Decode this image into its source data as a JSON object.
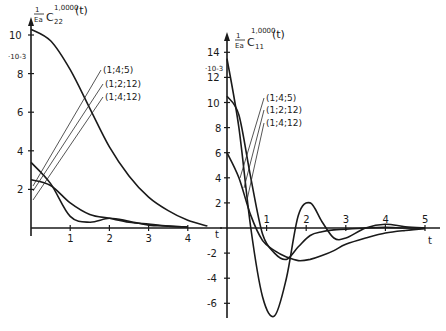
{
  "chart_data": [
    {
      "type": "line",
      "panel": "left",
      "title": "1/Ea C22^1,0000(t)",
      "title_parts": {
        "frac_num": "1",
        "frac_den": "Ea",
        "symbol": "C",
        "sub": "22",
        "sup": "1,0000",
        "arg": "(t)"
      },
      "scale_label": "·10-3",
      "xlabel": "t",
      "ylabel": "",
      "xlim": [
        0,
        4.7
      ],
      "ylim": [
        0,
        10.5
      ],
      "x_ticks": [
        "1",
        "2",
        "3",
        "4"
      ],
      "y_ticks": [
        "2",
        "4",
        "6",
        "8",
        "10"
      ],
      "grid": false,
      "legend_labels": [
        "(1;4;5)",
        "(1;2;12)",
        "(1;4;12)"
      ],
      "series": [
        {
          "name": "upper (monotone)",
          "x": [
            0,
            0.5,
            1.0,
            1.5,
            2.0,
            2.5,
            3.0,
            3.5,
            4.0,
            4.5
          ],
          "values": [
            10.3,
            9.7,
            8.2,
            6.2,
            4.2,
            2.7,
            1.6,
            0.9,
            0.4,
            0.1
          ]
        },
        {
          "name": "(1;4;5)",
          "x": [
            0,
            0.5,
            1.0,
            1.5,
            2.0,
            2.5,
            3.0,
            3.5,
            4.0
          ],
          "values": [
            3.4,
            2.3,
            0.6,
            0.3,
            0.5,
            0.35,
            0.15,
            0.1,
            0.05
          ]
        },
        {
          "name": "(1;4;12)",
          "x": [
            0,
            0.5,
            1.0,
            1.5,
            2.0,
            2.5,
            3.0,
            3.5,
            4.0
          ],
          "values": [
            2.5,
            2.2,
            1.3,
            0.7,
            0.5,
            0.3,
            0.2,
            0.1,
            0.05
          ]
        }
      ]
    },
    {
      "type": "line",
      "panel": "right",
      "title": "1/Ea C11^1,0000(t)",
      "title_parts": {
        "frac_num": "1",
        "frac_den": "Ea",
        "symbol": "C",
        "sub": "11",
        "sup": "1,0000",
        "arg": "(t)"
      },
      "scale_label": "·10-3",
      "xlabel": "t",
      "ylabel": "",
      "xlim": [
        0,
        5.2
      ],
      "ylim": [
        -7,
        14.5
      ],
      "x_ticks": [
        "1",
        "2",
        "3",
        "4",
        "5"
      ],
      "y_ticks": [
        "-6",
        "-4",
        "-2",
        "2",
        "4",
        "6",
        "8",
        "10",
        "12",
        "14"
      ],
      "grid": false,
      "legend_labels": [
        "(1;4;5)",
        "(1;2;12)",
        "(1;4;12)"
      ],
      "series": [
        {
          "name": "(1;4;5)",
          "x": [
            0,
            0.3,
            0.6,
            0.9,
            1.2,
            1.5,
            1.8,
            2.1,
            2.4,
            2.7,
            3.0,
            3.5,
            4.0,
            4.5,
            5.0
          ],
          "values": [
            13.5,
            8.0,
            0.0,
            -5.5,
            -7.0,
            -4.0,
            1.0,
            2.0,
            0.5,
            -0.8,
            -0.8,
            0.0,
            0.3,
            0.1,
            0.0
          ]
        },
        {
          "name": "(1;2;12)",
          "x": [
            0,
            0.3,
            0.6,
            0.9,
            1.2,
            1.5,
            1.8,
            2.1,
            2.4,
            2.7,
            3.0,
            3.5,
            4.0,
            4.5,
            5.0
          ],
          "values": [
            10.5,
            9.0,
            4.0,
            -0.5,
            -2.0,
            -2.5,
            -1.5,
            -0.6,
            -0.3,
            -0.15,
            -0.1,
            0.0,
            0.05,
            0.0,
            0.0
          ]
        },
        {
          "name": "(1;4;12)",
          "x": [
            0,
            0.3,
            0.6,
            0.9,
            1.2,
            1.5,
            1.8,
            2.1,
            2.4,
            2.7,
            3.0,
            3.5,
            4.0,
            4.5,
            5.0
          ],
          "values": [
            6.0,
            4.0,
            1.0,
            -1.0,
            -1.8,
            -2.3,
            -2.6,
            -2.5,
            -2.2,
            -1.8,
            -1.3,
            -0.8,
            -0.4,
            -0.2,
            -0.05
          ]
        }
      ]
    }
  ]
}
